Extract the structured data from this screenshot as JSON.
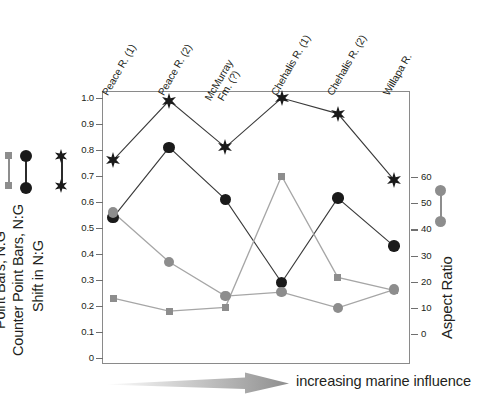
{
  "chart_data": {
    "type": "line",
    "title": "",
    "xlabel": "increasing marine influence",
    "ylabel": "Shift in N:G / Counter Point Bars, N:G / Point Bars, N:G",
    "y2label": "Aspect Ratio",
    "categories": [
      "Peace R. (1)",
      "Peace R. (2)",
      "McMurray Fm. (?)",
      "Chehalis R. (1)",
      "Chehalis R. (2)",
      "Willapa R."
    ],
    "ylim": [
      0,
      1.0
    ],
    "y2lim": [
      0,
      60
    ],
    "yticks": [
      "0",
      "0.1",
      "0.2",
      "0.3",
      "0.4",
      "0.5",
      "0.6",
      "0.7",
      "0.8",
      "0.9",
      "1.0"
    ],
    "y2ticks": [
      "0",
      "10",
      "20",
      "30",
      "40",
      "50",
      "60"
    ],
    "grid": false,
    "legend_position": "left",
    "series": [
      {
        "name": "Point Bars, N:G",
        "marker": "star",
        "color": "#1a1a1a",
        "axis": "left",
        "values": [
          0.76,
          0.99,
          0.81,
          1.0,
          0.94,
          0.685
        ]
      },
      {
        "name": "Shift in N:G",
        "marker": "circle",
        "color": "#1a1a1a",
        "axis": "left",
        "values": [
          0.54,
          0.81,
          0.61,
          0.29,
          0.615,
          0.43
        ]
      },
      {
        "name": "Counter Point Bars, N:G",
        "marker": "square",
        "color": "#8d8d8d",
        "axis": "left",
        "values": [
          0.23,
          0.18,
          0.195,
          0.7,
          0.31,
          0.26
        ]
      },
      {
        "name": "Aspect Ratio",
        "marker": "circle",
        "color": "#8d8d8d",
        "axis": "right",
        "values": [
          46.5,
          27.5,
          14.5,
          16.0,
          10.0,
          17.0
        ]
      }
    ]
  },
  "axes": {
    "left_ticks": [
      "1.0",
      "0.9",
      "0.8",
      "0.7",
      "0.6",
      "0.5",
      "0.4",
      "0.3",
      "0.2",
      "0.1",
      "0"
    ],
    "right_ticks": [
      "60",
      "50",
      "40",
      "30",
      "20",
      "10",
      "0"
    ]
  },
  "categories": [
    {
      "line1": "Peace R. (1)",
      "line2": ""
    },
    {
      "line1": "Peace R. (2)",
      "line2": ""
    },
    {
      "line1": "McMurray",
      "line2": "Fm. (?)"
    },
    {
      "line1": "Chehalis R. (1)",
      "line2": ""
    },
    {
      "line1": "Chehalis R. (2)",
      "line2": ""
    },
    {
      "line1": "Willapa R.",
      "line2": ""
    }
  ],
  "legend": {
    "items": [
      {
        "label": "Shift in N:G",
        "marker": "circle",
        "color": "#1a1a1a"
      },
      {
        "label": "Counter Point Bars, N:G",
        "marker": "square",
        "color": "#8d8d8d"
      },
      {
        "label": "Point Bars, N:G",
        "marker": "star",
        "color": "#1a1a1a"
      }
    ],
    "right_label": "Aspect Ratio"
  },
  "annotation": {
    "arrow_caption": "increasing marine influence"
  }
}
